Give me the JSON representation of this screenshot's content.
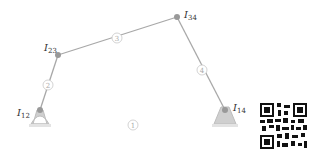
{
  "diagram": {
    "type": "four-bar-linkage",
    "colors": {
      "link": "#a8a8a8",
      "joint": "#999999",
      "ground": "#cfcfcf",
      "label": "#333333",
      "link_label": "#b0b0b0"
    },
    "joints": [
      {
        "id": "I12",
        "label": "I",
        "sub": "12"
      },
      {
        "id": "I23",
        "label": "I",
        "sub": "23"
      },
      {
        "id": "I34",
        "label": "I",
        "sub": "34"
      },
      {
        "id": "I14",
        "label": "I",
        "sub": "14"
      }
    ],
    "links": [
      {
        "id": "1",
        "label": "1"
      },
      {
        "id": "2",
        "label": "2"
      },
      {
        "id": "3",
        "label": "3"
      },
      {
        "id": "4",
        "label": "4"
      }
    ]
  }
}
